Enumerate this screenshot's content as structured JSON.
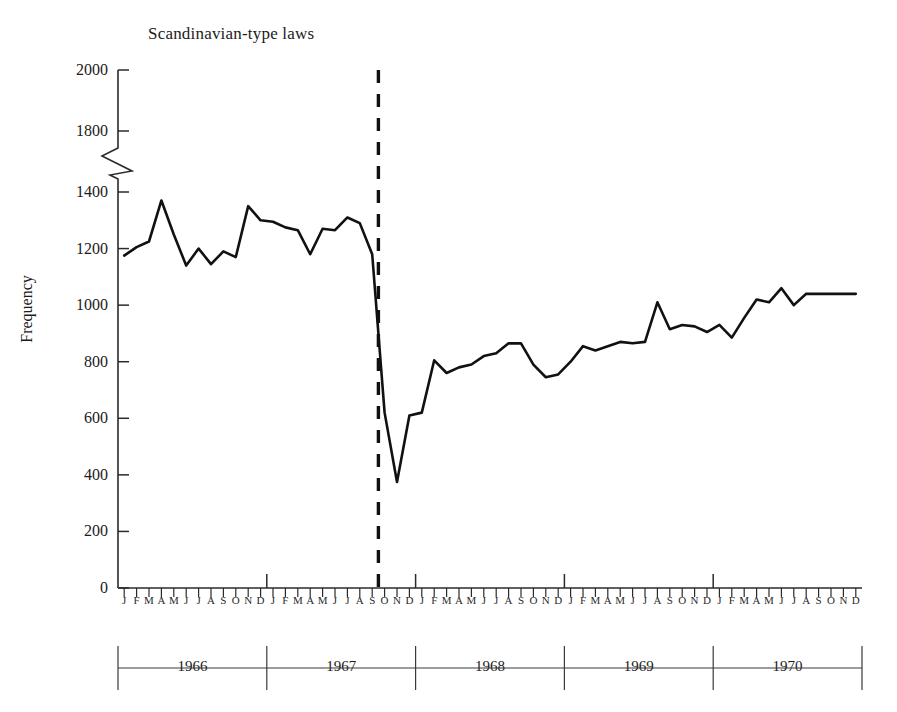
{
  "chart_data": {
    "type": "line",
    "title": "Scandinavian-type laws",
    "xlabel": "",
    "ylabel": "Frequency",
    "ylim": [
      0,
      2000
    ],
    "y_axis_break": {
      "from": 1400,
      "to": 1800,
      "style": "zigzag"
    },
    "yticks": [
      0,
      200,
      400,
      600,
      800,
      1000,
      1200,
      1400,
      1800,
      2000
    ],
    "ytick_labels": [
      "0",
      "200",
      "400",
      "600",
      "800",
      "1000",
      "1200",
      "1400",
      "1800",
      "2000"
    ],
    "grid": false,
    "legend": "none",
    "month_labels": [
      "J",
      "F",
      "M",
      "A",
      "M",
      "J",
      "J",
      "A",
      "S",
      "O",
      "N",
      "D"
    ],
    "years": [
      "1966",
      "1967",
      "1968",
      "1969",
      "1970"
    ],
    "x": [
      "1966-01",
      "1966-02",
      "1966-03",
      "1966-04",
      "1966-05",
      "1966-06",
      "1966-07",
      "1966-08",
      "1966-09",
      "1966-10",
      "1966-11",
      "1966-12",
      "1967-01",
      "1967-02",
      "1967-03",
      "1967-04",
      "1967-05",
      "1967-06",
      "1967-07",
      "1967-08",
      "1967-09",
      "1967-10",
      "1967-11",
      "1967-12",
      "1968-01",
      "1968-02",
      "1968-03",
      "1968-04",
      "1968-05",
      "1968-06",
      "1968-07",
      "1968-08",
      "1968-09",
      "1968-10",
      "1968-11",
      "1968-12",
      "1969-01",
      "1969-02",
      "1969-03",
      "1969-04",
      "1969-05",
      "1969-06",
      "1969-07",
      "1969-08",
      "1969-09",
      "1969-10",
      "1969-11",
      "1969-12",
      "1970-01",
      "1970-02",
      "1970-03",
      "1970-04",
      "1970-05",
      "1970-06",
      "1970-07",
      "1970-08",
      "1970-09",
      "1970-10",
      "1970-11",
      "1970-12"
    ],
    "values": [
      1175,
      1205,
      1225,
      1370,
      1250,
      1140,
      1200,
      1145,
      1190,
      1170,
      1350,
      1300,
      1295,
      1275,
      1265,
      1180,
      1270,
      1265,
      1310,
      1290,
      1180,
      620,
      375,
      610,
      620,
      805,
      760,
      780,
      790,
      820,
      830,
      865,
      865,
      790,
      745,
      755,
      800,
      855,
      840,
      855,
      870,
      865,
      870,
      1010,
      915,
      930,
      925,
      905,
      930,
      885,
      955,
      1020,
      1010,
      1060,
      1000,
      1040,
      1040,
      1040,
      1040,
      1040
    ],
    "annotations": [
      {
        "type": "vertical-dashed-line",
        "label": "intervention",
        "at": "1967-09/10"
      }
    ]
  },
  "figure": {
    "title": "Scandinavian-type laws",
    "ylabel": "Frequency"
  }
}
